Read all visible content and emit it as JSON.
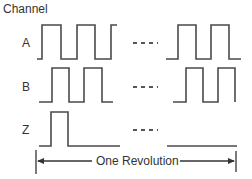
{
  "title": "Channel",
  "channels": [
    {
      "label": "A"
    },
    {
      "label": "B"
    },
    {
      "label": "Z"
    }
  ],
  "ellipsis": "- - -",
  "period_label": "One Revolution",
  "colors": {
    "stroke": "#4a4a4a",
    "text": "#333333",
    "background": "#ffffff"
  }
}
